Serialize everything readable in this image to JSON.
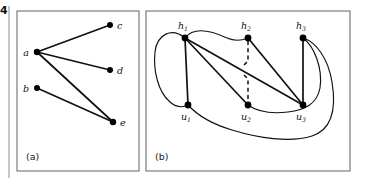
{
  "figure": {
    "margin_number": "4",
    "background_color": "#ffffff",
    "ink_color": "#111111",
    "frame_color": "#6f6f6f",
    "panels": [
      {
        "id": "panel-a",
        "caption": "(a)",
        "caption_x": 26,
        "caption_y": 160,
        "frame": {
          "x": 17,
          "y": 11,
          "w": 122,
          "h": 160
        },
        "type": "graph",
        "nodes": [
          {
            "id": "a",
            "label": "a",
            "sub": "",
            "x": 37,
            "y": 52,
            "r": 3.2,
            "label_x": 26,
            "label_y": 56
          },
          {
            "id": "b",
            "label": "b",
            "sub": "",
            "x": 37,
            "y": 88,
            "r": 3.0,
            "label_x": 26,
            "label_y": 92
          },
          {
            "id": "c",
            "label": "c",
            "sub": "",
            "x": 110,
            "y": 25,
            "r": 3.0,
            "label_x": 117,
            "label_y": 29
          },
          {
            "id": "d",
            "label": "d",
            "sub": "",
            "x": 110,
            "y": 70,
            "r": 3.0,
            "label_x": 117,
            "label_y": 74
          },
          {
            "id": "e",
            "label": "e",
            "sub": "",
            "x": 113,
            "y": 122,
            "r": 3.2,
            "label_x": 120,
            "label_y": 126
          }
        ],
        "edges": [
          {
            "from": "a",
            "to": "c"
          },
          {
            "from": "a",
            "to": "d"
          },
          {
            "from": "a",
            "to": "e"
          },
          {
            "from": "b",
            "to": "e"
          }
        ]
      },
      {
        "id": "panel-b",
        "caption": "(b)",
        "caption_x": 155,
        "caption_y": 160,
        "frame": {
          "x": 146,
          "y": 11,
          "w": 204,
          "h": 160
        },
        "type": "hypergraph-incidence",
        "nodes": [
          {
            "id": "h1",
            "label": "h",
            "sub": "1",
            "x": 185,
            "y": 38,
            "r": 3.4,
            "label_x": 178,
            "label_y": 29,
            "sub_dx": 6.0,
            "sub_dy": 2.2
          },
          {
            "id": "h2",
            "label": "h",
            "sub": "2",
            "x": 248,
            "y": 38,
            "r": 3.4,
            "label_x": 241,
            "label_y": 29,
            "sub_dx": 6.0,
            "sub_dy": 2.2
          },
          {
            "id": "h3",
            "label": "h",
            "sub": "3",
            "x": 303,
            "y": 38,
            "r": 3.4,
            "label_x": 296,
            "label_y": 29,
            "sub_dx": 6.0,
            "sub_dy": 2.2
          },
          {
            "id": "u1",
            "label": "u",
            "sub": "1",
            "x": 188,
            "y": 105,
            "r": 3.4,
            "label_x": 181,
            "label_y": 120,
            "sub_dx": 6.0,
            "sub_dy": 2.2
          },
          {
            "id": "u2",
            "label": "u",
            "sub": "2",
            "x": 248,
            "y": 105,
            "r": 3.4,
            "label_x": 241,
            "label_y": 120,
            "sub_dx": 6.0,
            "sub_dy": 2.2
          },
          {
            "id": "u3",
            "label": "u",
            "sub": "3",
            "x": 303,
            "y": 105,
            "r": 3.4,
            "label_x": 296,
            "label_y": 120,
            "sub_dx": 6.0,
            "sub_dy": 2.2
          }
        ],
        "straight_edges": [
          {
            "from": "h1",
            "to": "u1",
            "style": "solid"
          },
          {
            "from": "h1",
            "to": "u2",
            "style": "solid"
          },
          {
            "from": "h1",
            "to": "u3",
            "style": "solid"
          },
          {
            "from": "h2",
            "to": "u3",
            "style": "solid"
          },
          {
            "from": "h3",
            "to": "u3",
            "style": "solid"
          },
          {
            "from": "h2",
            "to": "u2",
            "style": "dashed"
          }
        ],
        "curved_edges": [
          {
            "from": "h1",
            "to": "u1",
            "note": "left outer loop"
          },
          {
            "from": "h1",
            "to": "h2",
            "note": "top arc"
          },
          {
            "from": "u1",
            "to": "h3",
            "note": "lower outer sweep"
          },
          {
            "from": "u2",
            "to": "h3",
            "note": "lower inner sweep"
          }
        ]
      }
    ]
  }
}
